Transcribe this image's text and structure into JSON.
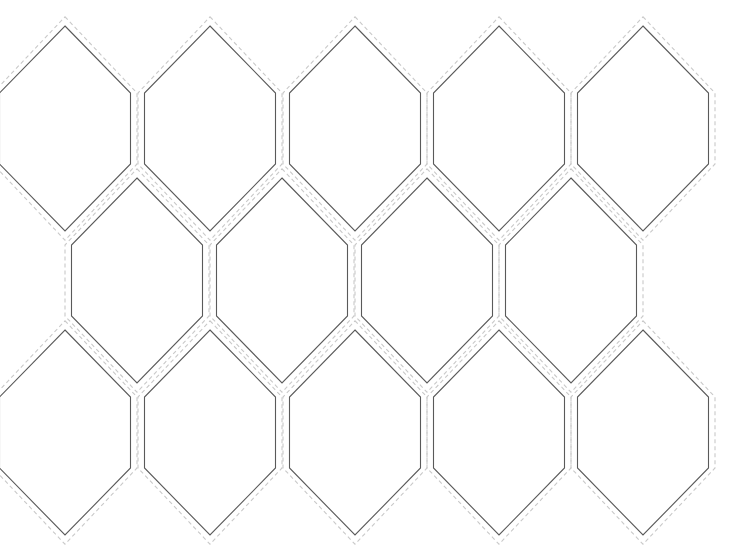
{
  "template": {
    "type": "elongated-hexagon-pattern",
    "background": "#ffffff",
    "colors": {
      "cut_line": "#5a5a5a",
      "seam_allowance_dashed": "#c9c9c9"
    },
    "hexagon": {
      "half_width": 65.5,
      "side_height": 71,
      "point_height": 67,
      "seam_offset": 6.5
    },
    "rows": [
      {
        "name": "row-1",
        "top": 26,
        "centers_x": [
          65,
          210,
          355,
          499,
          643
        ]
      },
      {
        "name": "row-2",
        "top": 178,
        "centers_x": [
          137,
          282,
          427,
          571
        ]
      },
      {
        "name": "row-3",
        "top": 330,
        "centers_x": [
          65,
          210,
          355,
          499,
          643
        ]
      }
    ]
  }
}
